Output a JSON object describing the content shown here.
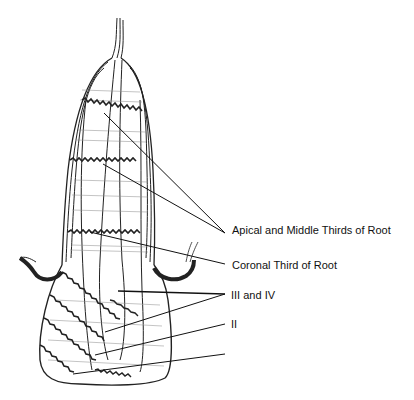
{
  "figure": {
    "labels": [
      {
        "id": "apical-middle",
        "text": "Apical and Middle Thirds of Root",
        "x": 232,
        "y": 224
      },
      {
        "id": "coronal",
        "text": "Coronal Third of Root",
        "x": 232,
        "y": 259
      },
      {
        "id": "iii-iv",
        "text": "III and IV",
        "x": 231,
        "y": 291
      },
      {
        "id": "ii",
        "text": "II",
        "x": 231,
        "y": 319
      }
    ],
    "leader_lines": [
      {
        "label": "apical-middle",
        "from": [
          104,
          113
        ],
        "to": [
          225,
          233
        ]
      },
      {
        "label": "apical-middle",
        "from": [
          103,
          164
        ],
        "to": [
          225,
          233
        ]
      },
      {
        "label": "coronal",
        "from": [
          90,
          232
        ],
        "to": [
          225,
          264
        ]
      },
      {
        "label": "iii-iv",
        "from": [
          118,
          291
        ],
        "to": [
          225,
          294
        ]
      },
      {
        "label": "iii-iv",
        "from": [
          105,
          332
        ],
        "to": [
          225,
          294
        ]
      },
      {
        "label": "ii",
        "from": [
          95,
          355
        ],
        "to": [
          225,
          324
        ]
      },
      {
        "label": null,
        "from": [
          73,
          374
        ],
        "to": [
          225,
          354
        ]
      }
    ],
    "colors": {
      "ink": "#111111",
      "background": "#ffffff"
    }
  }
}
